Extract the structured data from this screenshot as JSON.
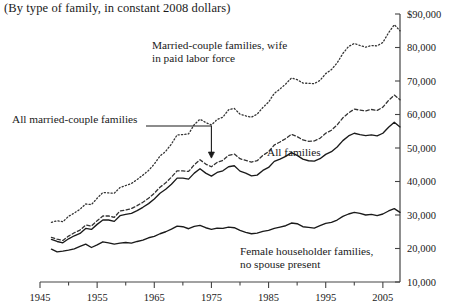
{
  "subtitle": "(By type of family, in constant 2008 dollars)",
  "annotations": {
    "married_wife_line1": "Married-couple families, wife",
    "married_wife_line2": "in paid labor force",
    "all_married": "All married-couple families",
    "all_families": "All families",
    "female_hh_line1": "Female householder families,",
    "female_hh_line2": "no spouse present"
  },
  "axis": {
    "y_ticks": [
      "$90,000",
      "80,000",
      "70,000",
      "60,000",
      "50,000",
      "40,000",
      "30,000",
      "20,000",
      "10,000"
    ],
    "x_ticks": [
      "1945",
      "1955",
      "1965",
      "1975",
      "1985",
      "1995",
      "2005"
    ]
  },
  "chart_data": {
    "type": "line",
    "title": "",
    "subtitle": "(By type of family, in constant 2008 dollars)",
    "xlabel": "",
    "ylabel": "",
    "xlim": [
      1945,
      2008
    ],
    "ylim": [
      10000,
      90000
    ],
    "ytick_values": [
      10000,
      20000,
      30000,
      40000,
      50000,
      60000,
      70000,
      80000,
      90000
    ],
    "xtick_values": [
      1945,
      1955,
      1965,
      1975,
      1985,
      1995,
      2005
    ],
    "xtick_minor_step": 5,
    "grid": false,
    "legend": "annotations-inline",
    "x": [
      1947,
      1948,
      1949,
      1950,
      1951,
      1952,
      1953,
      1954,
      1955,
      1956,
      1957,
      1958,
      1959,
      1960,
      1961,
      1962,
      1963,
      1964,
      1965,
      1966,
      1967,
      1968,
      1969,
      1970,
      1971,
      1972,
      1973,
      1974,
      1975,
      1976,
      1977,
      1978,
      1979,
      1980,
      1981,
      1982,
      1983,
      1984,
      1985,
      1986,
      1987,
      1988,
      1989,
      1990,
      1991,
      1992,
      1993,
      1994,
      1995,
      1996,
      1997,
      1998,
      1999,
      2000,
      2001,
      2002,
      2003,
      2004,
      2005,
      2006,
      2007,
      2008
    ],
    "series": [
      {
        "name": "Married-couple families, wife in paid labor force",
        "style": "dotted",
        "color": "#333333",
        "values": [
          27800,
          28300,
          28000,
          29600,
          30600,
          31700,
          33300,
          33100,
          35000,
          36700,
          36600,
          36500,
          38200,
          38800,
          39400,
          40600,
          41900,
          43300,
          45200,
          47600,
          49000,
          51200,
          53900,
          54000,
          54200,
          57000,
          58600,
          57600,
          56900,
          58500,
          59200,
          61400,
          61800,
          60100,
          59600,
          59200,
          60100,
          62100,
          63700,
          66300,
          67600,
          69100,
          70900,
          70400,
          69400,
          69300,
          69200,
          70200,
          72200,
          73400,
          75400,
          78200,
          80300,
          81200,
          80600,
          80100,
          80600,
          80500,
          81500,
          84400,
          86800,
          85000
        ]
      },
      {
        "name": "All married-couple families",
        "style": "dashed",
        "color": "#333333",
        "values": [
          23300,
          22800,
          22400,
          23700,
          24700,
          25500,
          27000,
          26700,
          28300,
          29700,
          29700,
          29300,
          31200,
          31500,
          31900,
          32800,
          33800,
          35000,
          36500,
          38300,
          39600,
          41300,
          43200,
          43200,
          43000,
          45000,
          46500,
          45200,
          44400,
          45700,
          46300,
          47800,
          48200,
          46800,
          46300,
          45800,
          46200,
          47800,
          48900,
          50900,
          51800,
          52800,
          54100,
          53400,
          52400,
          52000,
          52100,
          52900,
          54400,
          55300,
          56900,
          59000,
          60500,
          61600,
          61300,
          61100,
          61500,
          61200,
          62200,
          64200,
          65800,
          64400
        ]
      },
      {
        "name": "All families",
        "style": "solid",
        "color": "#1a1a1a",
        "values": [
          22700,
          22100,
          21700,
          22900,
          23800,
          24500,
          26000,
          25700,
          27200,
          28500,
          28500,
          28100,
          29800,
          30200,
          30500,
          31300,
          32300,
          33400,
          34800,
          36500,
          37700,
          39200,
          41000,
          41000,
          40700,
          42500,
          43800,
          42500,
          41600,
          42700,
          43200,
          44400,
          44700,
          43100,
          42500,
          41700,
          41900,
          43300,
          44200,
          46000,
          46700,
          47500,
          48600,
          47800,
          46700,
          46200,
          46100,
          46800,
          48100,
          48900,
          50300,
          52200,
          53600,
          54400,
          54000,
          53700,
          53900,
          53600,
          54400,
          56200,
          57700,
          56300
        ]
      },
      {
        "name": "Female householder families, no spouse present",
        "style": "solid",
        "color": "#1a1a1a",
        "values": [
          19800,
          19000,
          19200,
          19500,
          19900,
          20600,
          21300,
          20300,
          21100,
          22000,
          21700,
          21300,
          21600,
          21800,
          21600,
          22100,
          22500,
          23200,
          23600,
          24400,
          25000,
          25800,
          26700,
          26500,
          25900,
          26600,
          26900,
          26200,
          25700,
          26100,
          26000,
          26400,
          26200,
          25400,
          24800,
          24400,
          24600,
          25100,
          25400,
          26000,
          26400,
          26800,
          27600,
          27400,
          26500,
          26300,
          26100,
          26800,
          27500,
          27800,
          28500,
          29600,
          30300,
          30800,
          30500,
          30000,
          30200,
          29800,
          30300,
          31200,
          31900,
          30800
        ]
      }
    ]
  }
}
